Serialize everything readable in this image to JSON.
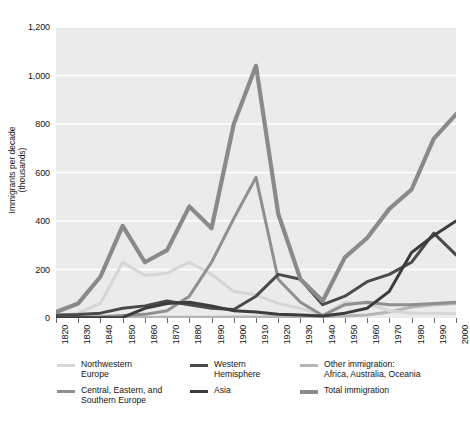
{
  "chart_data": {
    "type": "line",
    "title": "",
    "xlabel": "",
    "ylabel": "Immigrants per decade\n(thousands)",
    "xlim": [
      1820,
      2000
    ],
    "ylim": [
      0,
      1200
    ],
    "ytick_step": 200,
    "grid": "horizontal-white",
    "legend_position": "below",
    "plot_background": "#ebebeb",
    "x": [
      1820,
      1830,
      1840,
      1850,
      1860,
      1870,
      1880,
      1890,
      1900,
      1910,
      1920,
      1930,
      1940,
      1950,
      1960,
      1970,
      1980,
      1990,
      2000
    ],
    "xtick_labels": [
      "1820",
      "1830",
      "1840",
      "1850",
      "1860",
      "1870",
      "1880",
      "1890",
      "1900",
      "1910",
      "1920",
      "1930",
      "1940",
      "1950",
      "1960",
      "1970",
      "1980",
      "1990",
      "2000"
    ],
    "ytick_labels": [
      "0",
      "200",
      "400",
      "600",
      "800",
      "1,000",
      "1,200"
    ],
    "ytick_values": [
      0,
      200,
      400,
      600,
      800,
      1000,
      1200
    ],
    "series": [
      {
        "name": "Northwestern Europe",
        "key": "northwestern_europe",
        "color": "#d6d6d6",
        "width": 3.0,
        "values": [
          8,
          20,
          60,
          230,
          175,
          185,
          230,
          180,
          110,
          95,
          60,
          40,
          12,
          65,
          60,
          30,
          20,
          20,
          18
        ]
      },
      {
        "name": "Central, Eastern, and Southern Europe",
        "key": "central_eastern_southern_europe",
        "color": "#8f8f8f",
        "width": 3.0,
        "values": [
          3,
          4,
          5,
          10,
          15,
          30,
          90,
          230,
          410,
          580,
          160,
          65,
          10,
          55,
          65,
          55,
          55,
          60,
          65
        ]
      },
      {
        "name": "Western Hemisphere",
        "key": "western_hemisphere",
        "color": "#4a4a4a",
        "width": 3.0,
        "values": [
          12,
          14,
          20,
          40,
          50,
          70,
          55,
          40,
          35,
          90,
          180,
          160,
          55,
          90,
          150,
          180,
          230,
          350,
          260
        ]
      },
      {
        "name": "Asia",
        "key": "asia",
        "color": "#3c3c3c",
        "width": 3.0,
        "values": [
          1,
          1,
          1,
          2,
          40,
          60,
          65,
          50,
          30,
          25,
          15,
          12,
          8,
          20,
          40,
          110,
          270,
          340,
          400
        ]
      },
      {
        "name": "Other immigration: Africa, Australia, Oceania",
        "key": "other_immigration",
        "color": "#b5b5b5",
        "width": 3.0,
        "values": [
          1,
          1,
          1,
          2,
          2,
          3,
          3,
          3,
          4,
          4,
          5,
          6,
          5,
          8,
          12,
          25,
          45,
          55,
          60
        ]
      },
      {
        "name": "Total immigration",
        "key": "total_immigration",
        "color": "#8a8a8a",
        "width": 4.2,
        "values": [
          145,
          600,
          1713,
          2598,
          2315,
          2812,
          5247,
          3688,
          8795,
          5736,
          4107,
          528,
          1035,
          2515,
          3322,
          4493,
          7338,
          9095,
          8400
        ]
      }
    ],
    "total_immigration_plot_values": [
      25,
      60,
      170,
      380,
      230,
      280,
      460,
      370,
      800,
      1040,
      430,
      160,
      70,
      250,
      330,
      450,
      530,
      740,
      840
    ]
  },
  "legend": {
    "columns": [
      {
        "items": [
          {
            "label": "Northwestern\nEurope",
            "color": "#d6d6d6",
            "thick": false
          },
          {
            "label": "Central, Eastern, and\nSouthern Europe",
            "color": "#8f8f8f",
            "thick": false
          }
        ]
      },
      {
        "items": [
          {
            "label": "Western\nHemisphere",
            "color": "#4a4a4a",
            "thick": false
          },
          {
            "label": "Asia",
            "color": "#3c3c3c",
            "thick": false
          }
        ]
      },
      {
        "items": [
          {
            "label": "Other immigration:\nAfrica, Australia, Oceania",
            "color": "#b5b5b5",
            "thick": false
          },
          {
            "label": "Total immigration",
            "color": "#8a8a8a",
            "thick": true
          }
        ]
      }
    ]
  }
}
